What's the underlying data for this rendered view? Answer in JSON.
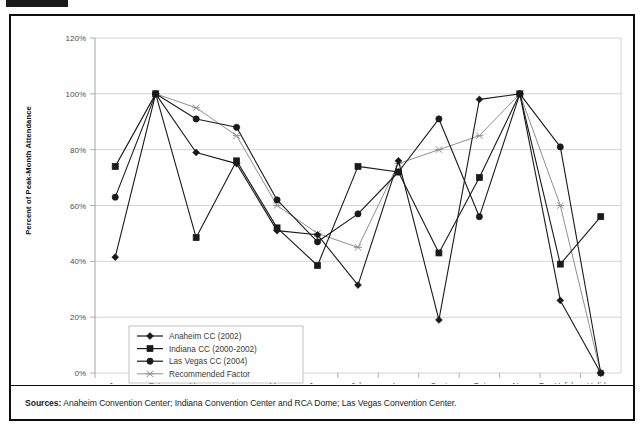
{
  "figure": {
    "corner_mark": "",
    "sources_prefix": "Sources:",
    "sources_text": " Anaheim Convention Center; Indiana Convention Center and RCA Dome; Las Vegas Convention Center."
  },
  "chart_data": {
    "type": "line",
    "title": "",
    "xlabel": "",
    "ylabel": "Percent of Peak-Month Attendance",
    "ylim": [
      0,
      120
    ],
    "yticks": [
      0,
      20,
      40,
      60,
      80,
      100,
      120
    ],
    "ytick_labels": [
      "0%",
      "20%",
      "40%",
      "60%",
      "80%",
      "100%",
      "120%"
    ],
    "grid": true,
    "legend_position": "lower-left-inside",
    "categories": [
      "Jan",
      "Feb",
      "Mar",
      "Apr",
      "May",
      "June",
      "July",
      "Aug",
      "Sept",
      "Oct",
      "Nov",
      "Pre-Holiday\nDec",
      "Holiday\nDec"
    ],
    "categories_display": [
      {
        "line1": "Jan",
        "line2": ""
      },
      {
        "line1": "Feb",
        "line2": ""
      },
      {
        "line1": "Mar",
        "line2": ""
      },
      {
        "line1": "Apr",
        "line2": ""
      },
      {
        "line1": "May",
        "line2": ""
      },
      {
        "line1": "June",
        "line2": ""
      },
      {
        "line1": "July",
        "line2": ""
      },
      {
        "line1": "Aug",
        "line2": ""
      },
      {
        "line1": "Sept",
        "line2": ""
      },
      {
        "line1": "Oct",
        "line2": ""
      },
      {
        "line1": "Nov",
        "line2": ""
      },
      {
        "line1": "Pre-Holiday",
        "line2": "Dec"
      },
      {
        "line1": "Holiday",
        "line2": "Dec"
      }
    ],
    "series": [
      {
        "name": "Anaheim CC (2002)",
        "marker": "diamond",
        "color": "#1a1a1a",
        "values": [
          41.5,
          100,
          79,
          75,
          51,
          49.5,
          31.5,
          76,
          19,
          98,
          100,
          26,
          0
        ]
      },
      {
        "name": "Indiana CC (2000-2002)",
        "marker": "square",
        "color": "#1a1a1a",
        "values": [
          74,
          100,
          48.5,
          76,
          52,
          38.5,
          74,
          72,
          43,
          70,
          100,
          39,
          56
        ]
      },
      {
        "name": "Las Vegas CC (2004)",
        "marker": "circle",
        "color": "#1a1a1a",
        "values": [
          63,
          100,
          91,
          88,
          62,
          47,
          57,
          72,
          91,
          56,
          100,
          81,
          0
        ]
      },
      {
        "name": "Recommended Factor",
        "marker": "star-x",
        "color": "#8f8f8f",
        "values": [
          74,
          100,
          95,
          85,
          60,
          50,
          45,
          75,
          80,
          85,
          100,
          60,
          0
        ]
      }
    ]
  }
}
